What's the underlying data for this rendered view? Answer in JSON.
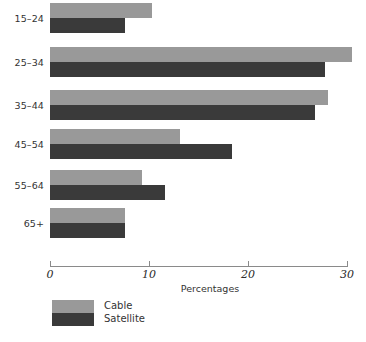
{
  "chart_data": {
    "type": "bar",
    "orientation": "horizontal",
    "title": "",
    "xlabel": "Percentages",
    "ylabel": "",
    "xlim": [
      0,
      30
    ],
    "xticks": [
      0,
      10,
      20,
      30
    ],
    "xtick_labels": [
      "0",
      "10",
      "20",
      "30"
    ],
    "grid": false,
    "legend_position": "bottom-left",
    "categories": [
      "15–24",
      "25–34",
      "35–44",
      "45–54",
      "55–64",
      "65+"
    ],
    "series": [
      {
        "name": "Cable",
        "color": "#999999",
        "values": [
          10.3,
          30.5,
          28.1,
          13.1,
          9.3,
          7.6
        ]
      },
      {
        "name": "Satellite",
        "color": "#3a3a3a",
        "values": [
          7.6,
          27.8,
          26.8,
          18.4,
          11.6,
          7.6
        ]
      }
    ]
  },
  "legend": {
    "items": [
      {
        "label": "Cable",
        "color": "#999999"
      },
      {
        "label": "Satellite",
        "color": "#3a3a3a"
      }
    ]
  },
  "axis": {
    "title": "Percentages"
  }
}
